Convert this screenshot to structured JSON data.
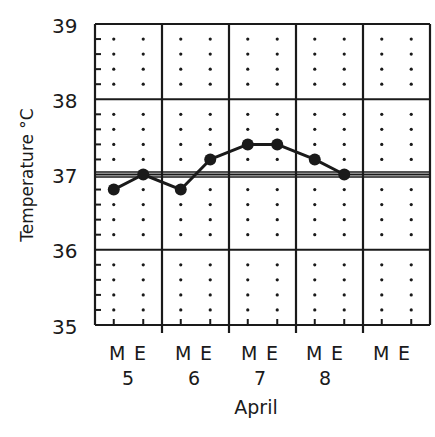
{
  "chart_data": {
    "type": "line",
    "title": "",
    "xlabel": "April",
    "ylabel": "Temperature °C",
    "ylim": [
      35,
      39
    ],
    "yticks": [
      "35",
      "36",
      "37",
      "38",
      "39"
    ],
    "y_minor_step": 0.2,
    "reference_line": 37.0,
    "days": [
      "5",
      "6",
      "7",
      "8",
      ""
    ],
    "periods": [
      "M",
      "E"
    ],
    "categories": [
      "5 M",
      "5 E",
      "6 M",
      "6 E",
      "7 M",
      "7 E",
      "8 M",
      "8 E"
    ],
    "series": [
      {
        "name": "Temperature",
        "values": [
          36.8,
          37.0,
          36.8,
          37.2,
          37.4,
          37.4,
          37.2,
          37.0
        ]
      }
    ],
    "grid": true,
    "legend": "none"
  },
  "labels": {
    "ylabel": "Temperature °C",
    "xlabel": "April",
    "y35": "35",
    "y36": "36",
    "y37": "37",
    "y38": "38",
    "y39": "39",
    "M": "M",
    "E": "E",
    "d5": "5",
    "d6": "6",
    "d7": "7",
    "d8": "8"
  },
  "colors": {
    "ink": "#1a1a1a",
    "background": "#ffffff"
  }
}
